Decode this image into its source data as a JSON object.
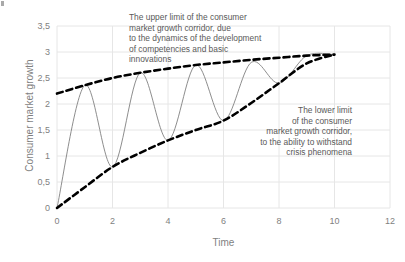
{
  "chart_data": {
    "type": "line",
    "title": "",
    "xlabel": "Time",
    "ylabel": "Consumer market growth",
    "xlim": [
      0,
      12
    ],
    "ylim": [
      0,
      3.5
    ],
    "grid": true,
    "legend": "none",
    "decimal_separator": ",",
    "x_ticks": [
      "0",
      "2",
      "4",
      "6",
      "8",
      "10",
      "12"
    ],
    "x_tick_values": [
      0,
      2,
      4,
      6,
      8,
      10,
      12
    ],
    "y_ticks": [
      "0",
      "0,5",
      "1",
      "1,5",
      "2",
      "2,5",
      "3",
      "3,5"
    ],
    "y_tick_values": [
      0,
      0.5,
      1,
      1.5,
      2,
      2.5,
      3,
      3.5
    ],
    "series": [
      {
        "name": "Upper limit of consumer market growth corridor",
        "style": "dashed",
        "color": "#000000",
        "x": [
          0,
          1,
          2,
          3,
          4,
          5,
          6,
          7,
          8,
          9,
          10
        ],
        "values": [
          2.2,
          2.36,
          2.5,
          2.6,
          2.68,
          2.75,
          2.8,
          2.85,
          2.89,
          2.93,
          2.95
        ]
      },
      {
        "name": "Lower limit of consumer market growth corridor",
        "style": "dashed",
        "color": "#000000",
        "x": [
          0,
          1,
          2,
          3,
          4,
          5,
          6,
          7,
          8,
          9,
          10
        ],
        "values": [
          0.0,
          0.4,
          0.79,
          1.06,
          1.3,
          1.5,
          1.68,
          2.02,
          2.4,
          2.78,
          2.95
        ]
      },
      {
        "name": "Consumer market growth trajectory",
        "style": "solid",
        "color": "#808080",
        "x": [
          0,
          1,
          2,
          3,
          4,
          5,
          6,
          7,
          8,
          9,
          10
        ],
        "values": [
          0.0,
          2.36,
          0.79,
          2.6,
          1.3,
          2.75,
          1.68,
          2.8,
          2.4,
          2.93,
          2.95
        ]
      }
    ],
    "annotations": [
      {
        "name": "upper-limit-annotation",
        "align": "left",
        "text": "The upper limit of the consumer\nmarket growth corridor, due\nto the dynamics of the development\nof competencies and basic\ninnovations"
      },
      {
        "name": "lower-limit-annotation",
        "align": "right",
        "text": "The lower limit\nof the consumer\nmarket growth corridor,\nto the ability to withstand\ncrisis phenomena"
      }
    ],
    "colors": {
      "gridline": "#e6e6e6",
      "axis_text": "#7f7f7f",
      "annotation_text": "#595959",
      "boundary_line": "#000000",
      "trajectory_line": "#808080",
      "background": "#ffffff"
    }
  }
}
